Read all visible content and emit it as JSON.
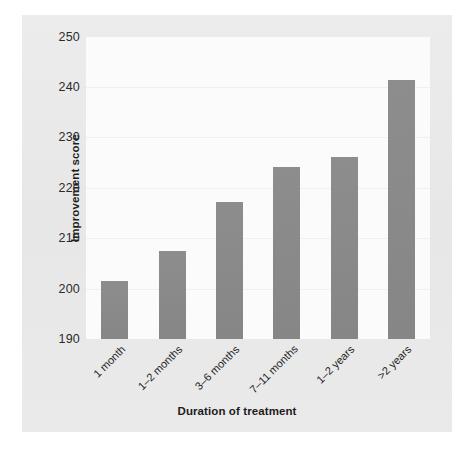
{
  "chart_data": {
    "type": "bar",
    "title": "",
    "xlabel": "Duration of treatment",
    "ylabel": "Improvement score",
    "categories": [
      "1 month",
      "1–2 months",
      "3–6 months",
      "7–11 months",
      "1–2 years",
      ">2 years"
    ],
    "values": [
      201.5,
      207.5,
      217.3,
      224.2,
      226.2,
      241.5
    ],
    "ylim": [
      190,
      250
    ],
    "yticks": [
      190,
      200,
      210,
      220,
      230,
      240,
      250
    ],
    "ytick_labels": [
      "190",
      "200",
      "210",
      "220",
      "230",
      "240",
      "250"
    ],
    "grid": true,
    "legend": "none",
    "bar_color": "#8a8a8a",
    "plot_background": "#fbfbfb",
    "panel_background": "#e9e9e9",
    "figure_background": "#ffffff",
    "text_color": "#1d1d1d"
  }
}
